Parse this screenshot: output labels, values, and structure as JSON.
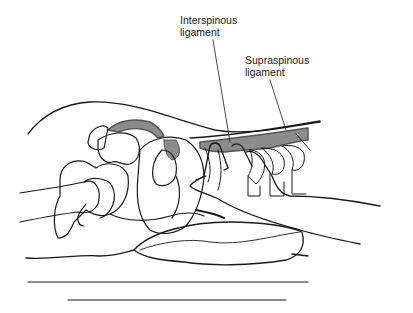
{
  "figure": {
    "labels": [
      {
        "id": "interspinous",
        "line1": "Interspinous",
        "line2": "ligament"
      },
      {
        "id": "supraspinous",
        "line1": "Supraspinous",
        "line2": "ligament"
      }
    ],
    "colors": {
      "outline": "#1a1a1a",
      "ligament_fill": "#8c8c8c",
      "ligament_dark": "#555555",
      "background": "#ffffff"
    }
  }
}
